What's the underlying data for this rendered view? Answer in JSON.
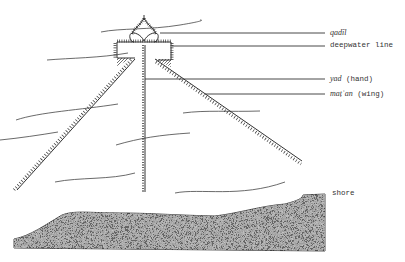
{
  "diagram": {
    "type": "fish-trap schematic (line drawing)",
    "colors": {
      "ink": "#333333",
      "background": "#ffffff",
      "shore_fill": "#555555"
    }
  },
  "labels": {
    "qadil": "qadīl",
    "deepwater_line": "deepwater line",
    "yad": "yad",
    "yad_gloss": "(hand)",
    "matan": "maṭʿan",
    "matan_gloss": "(wing)",
    "shore": "shore"
  }
}
